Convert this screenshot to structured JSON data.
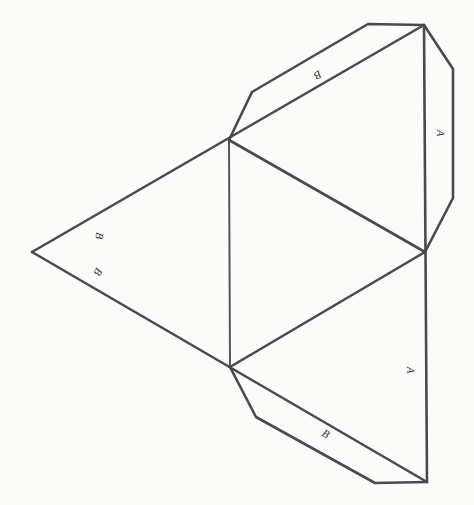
{
  "diagram": {
    "stroke_color": "#4a4a4a",
    "background": "#fbfbfa",
    "faces": [
      {
        "name": "face-left"
      },
      {
        "name": "face-center"
      },
      {
        "name": "face-upper-right"
      },
      {
        "name": "face-lower-right"
      }
    ],
    "tabs": [
      {
        "name": "tab-upper",
        "label": "B"
      },
      {
        "name": "tab-right",
        "label": "A"
      },
      {
        "name": "tab-lower",
        "label": "B"
      }
    ],
    "edge_labels": [
      {
        "name": "label-left-upper",
        "text": "B"
      },
      {
        "name": "label-left-lower",
        "text": "B"
      },
      {
        "name": "label-lower-right-face",
        "text": "A"
      }
    ]
  }
}
